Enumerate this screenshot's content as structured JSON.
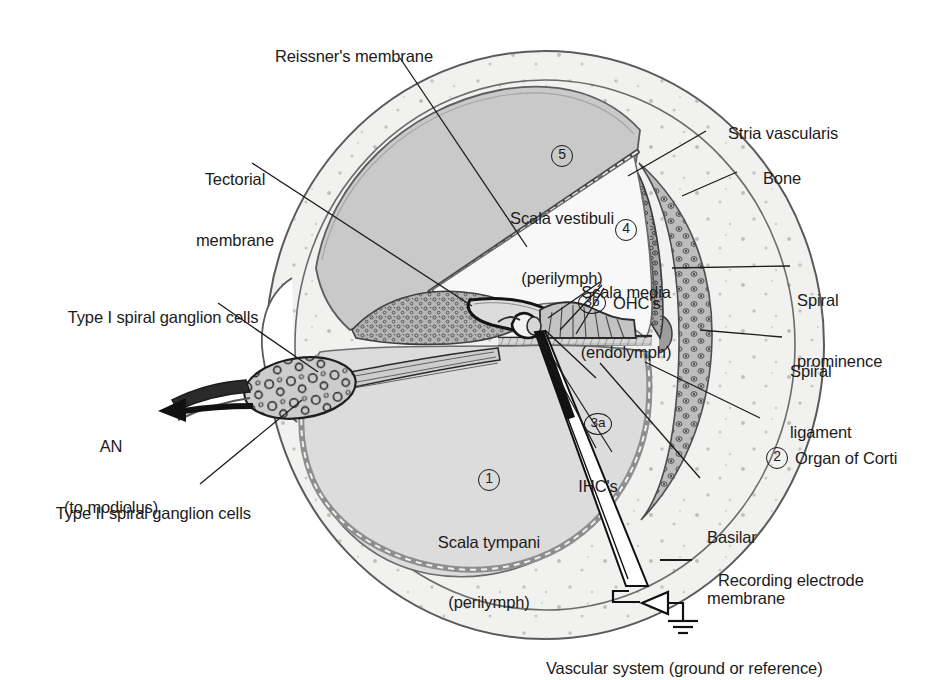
{
  "figure": {
    "background_color": "#ffffff",
    "ink_color": "#1b1b1b"
  },
  "palette": {
    "bone": "#f1f1ef",
    "scala_vestibuli": "#c9c9c9",
    "scala_tympani": "#dcdcdc",
    "scala_media": "#f7f7f7",
    "spiral_ligament": "#bdbdbd",
    "stria_vascularis": "#9a9a9a",
    "ganglion": "#cfcfcf",
    "outline": "#4a4a4a",
    "dark_outline": "#1b1b1b"
  },
  "labels": {
    "reissners_membrane": "Reissner's membrane",
    "tectorial_membrane_l1": "Tectorial",
    "tectorial_membrane_l2": "membrane",
    "scala_vestibuli_num": "5",
    "scala_vestibuli_l1": "Scala vestibuli",
    "scala_vestibuli_l2": "(perilymph)",
    "scala_media_num": "4",
    "scala_media_l1": "Scala media",
    "scala_media_l2": "(endolymph)",
    "ohc_num": "3b",
    "ohc_text": "OHC's",
    "ihc_num": "3a",
    "ihc_text": "IHC's",
    "scala_tympani_num": "1",
    "scala_tympani_l1": "Scala tympani",
    "scala_tympani_l2": "(perilymph)",
    "stria_vascularis": "Stria vascularis",
    "bone": "Bone",
    "spiral_prominence_l1": "Spiral",
    "spiral_prominence_l2": "prominence",
    "spiral_ligament_l1": "Spiral",
    "spiral_ligament_l2": "ligament",
    "organ_of_corti_num": "2",
    "organ_of_corti_text": "Organ of Corti",
    "basilar_membrane_l1": "Basilar",
    "basilar_membrane_l2": "membrane",
    "type_i_ganglion": "Type I spiral ganglion cells",
    "type_ii_ganglion": "Type II spiral ganglion cells",
    "an_l1": "AN",
    "an_l2": "(to modiolus)",
    "recording_electrode": "Recording electrode",
    "vascular_system": "Vascular system (ground or reference)"
  },
  "icons": {
    "an_arrow": "arrow-left-icon",
    "ground": "ground-symbol-icon",
    "amplifier": "amplifier-triangle-icon",
    "electrode": "electrode-probe-icon"
  }
}
